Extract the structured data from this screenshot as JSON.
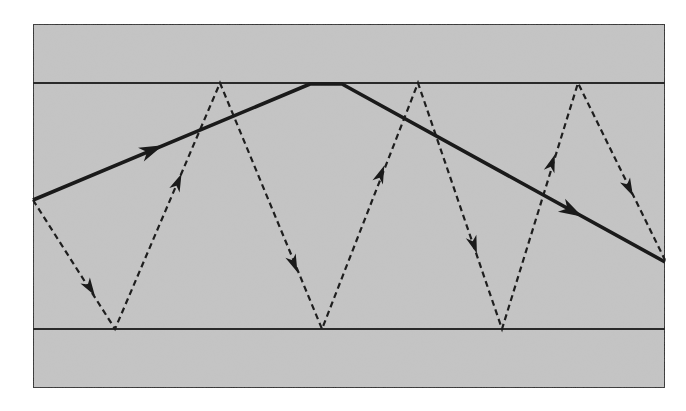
{
  "diagram": {
    "colors": {
      "background": "#ffffff",
      "fill": "#c4c4c4",
      "stroke": "#2a2a2a"
    },
    "frame": {
      "x": 33,
      "y": 24,
      "width": 632,
      "height": 364
    },
    "interfaces": {
      "upper_y": 83,
      "lower_y": 329
    },
    "layers": [
      {
        "name": "upper-cladding",
        "y1": 24,
        "y2": 83
      },
      {
        "name": "core",
        "y1": 83,
        "y2": 329
      },
      {
        "name": "lower-cladding",
        "y1": 329,
        "y2": 388
      }
    ],
    "solid_ray": {
      "points": [
        [
          33,
          200
        ],
        [
          310,
          84
        ],
        [
          342,
          84
        ],
        [
          665,
          262
        ]
      ],
      "arrows": [
        {
          "x": 152,
          "y": 150,
          "angle": -22.7
        },
        {
          "x": 572,
          "y": 211,
          "angle": 28.9
        }
      ]
    },
    "dashed_ray": {
      "points": [
        [
          33,
          200
        ],
        [
          115,
          329
        ],
        [
          220,
          83
        ],
        [
          322,
          329
        ],
        [
          418,
          83
        ],
        [
          502,
          329
        ],
        [
          578,
          83
        ],
        [
          665,
          260
        ]
      ],
      "arrows": [
        {
          "x": 90,
          "y": 288,
          "angle": 57.6
        },
        {
          "x": 178,
          "y": 182,
          "angle": -66.9
        },
        {
          "x": 294,
          "y": 264,
          "angle": 67.5
        },
        {
          "x": 381,
          "y": 174,
          "angle": -68.6
        },
        {
          "x": 474,
          "y": 245,
          "angle": 71.1
        },
        {
          "x": 552,
          "y": 163,
          "angle": -71.3
        },
        {
          "x": 629,
          "y": 188,
          "angle": 63.8
        }
      ]
    }
  }
}
